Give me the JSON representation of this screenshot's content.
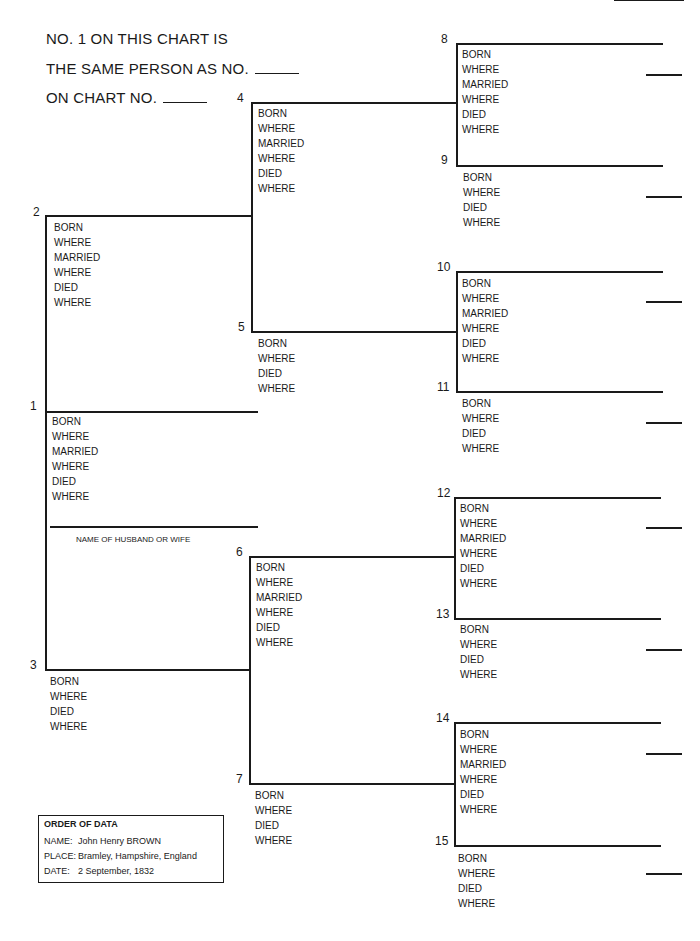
{
  "header": {
    "line1": "NO. 1 ON THIS CHART IS",
    "line2": "THE SAME PERSON AS NO.",
    "line3": "ON CHART NO."
  },
  "labels": {
    "full": [
      "BORN",
      "WHERE",
      "MARRIED",
      "WHERE",
      "DIED",
      "WHERE"
    ],
    "short": [
      "BORN",
      "WHERE",
      "DIED",
      "WHERE"
    ]
  },
  "spouse_label": "NAME OF HUSBAND OR WIFE",
  "numbers": [
    "1",
    "2",
    "3",
    "4",
    "5",
    "6",
    "7",
    "8",
    "9",
    "10",
    "11",
    "12",
    "13",
    "14",
    "15"
  ],
  "order_of_data": {
    "title": "ORDER OF DATA",
    "rows": [
      {
        "key": "NAME:",
        "value": "John Henry BROWN"
      },
      {
        "key": "PLACE:",
        "value": "Bramley, Hampshire, England"
      },
      {
        "key": "DATE:",
        "value": "2 September, 1832"
      }
    ]
  }
}
